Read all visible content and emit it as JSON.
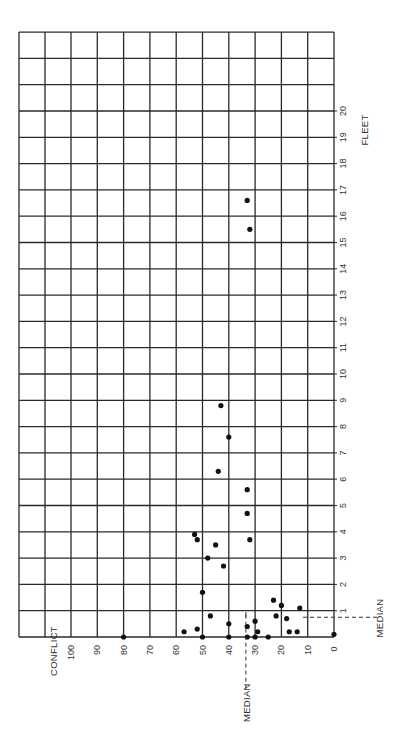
{
  "chart_data": {
    "type": "scatter",
    "orientation": "rotated-90-ccw",
    "title": "",
    "xlabel": "CONFLICT",
    "ylabel": "FLEET",
    "xlim": [
      0,
      100
    ],
    "ylim": [
      0,
      23
    ],
    "x_ticks": [
      100,
      90,
      80,
      70,
      60,
      50,
      40,
      30,
      20,
      10,
      0
    ],
    "y_ticks": [
      1,
      2,
      3,
      4,
      5,
      6,
      7,
      8,
      9,
      10,
      11,
      12,
      13,
      14,
      15,
      16,
      17,
      18,
      19,
      20
    ],
    "grid": true,
    "points": [
      {
        "conflict": 80,
        "fleet": 0.0
      },
      {
        "conflict": 57,
        "fleet": 0.2
      },
      {
        "conflict": 52,
        "fleet": 0.3
      },
      {
        "conflict": 50,
        "fleet": 0.0
      },
      {
        "conflict": 50,
        "fleet": 1.7
      },
      {
        "conflict": 47,
        "fleet": 0.8
      },
      {
        "conflict": 40,
        "fleet": 0.5
      },
      {
        "conflict": 40,
        "fleet": 0.0
      },
      {
        "conflict": 33,
        "fleet": 0.4
      },
      {
        "conflict": 33,
        "fleet": 0.0
      },
      {
        "conflict": 30,
        "fleet": 0.6
      },
      {
        "conflict": 29,
        "fleet": 0.2
      },
      {
        "conflict": 30,
        "fleet": 0.0
      },
      {
        "conflict": 25,
        "fleet": 0.0
      },
      {
        "conflict": 23,
        "fleet": 1.4
      },
      {
        "conflict": 20,
        "fleet": 1.2
      },
      {
        "conflict": 22,
        "fleet": 0.8
      },
      {
        "conflict": 18,
        "fleet": 0.7
      },
      {
        "conflict": 17,
        "fleet": 0.2
      },
      {
        "conflict": 13,
        "fleet": 1.1
      },
      {
        "conflict": 14,
        "fleet": 0.2
      },
      {
        "conflict": 0,
        "fleet": 0.1
      },
      {
        "conflict": 53,
        "fleet": 3.9
      },
      {
        "conflict": 52,
        "fleet": 3.7
      },
      {
        "conflict": 48,
        "fleet": 3.0
      },
      {
        "conflict": 45,
        "fleet": 3.5
      },
      {
        "conflict": 42,
        "fleet": 2.7
      },
      {
        "conflict": 33,
        "fleet": 4.7
      },
      {
        "conflict": 32,
        "fleet": 3.7
      },
      {
        "conflict": 33,
        "fleet": 5.6
      },
      {
        "conflict": 44,
        "fleet": 6.3
      },
      {
        "conflict": 40,
        "fleet": 7.6
      },
      {
        "conflict": 43,
        "fleet": 8.8
      },
      {
        "conflict": 33,
        "fleet": 16.6
      },
      {
        "conflict": 32,
        "fleet": 15.5
      }
    ],
    "annotations": [
      {
        "text": "MEDIAN",
        "axis": "conflict",
        "value": 33.5
      },
      {
        "text": "MEDIAN",
        "axis": "fleet",
        "value": 0.75
      }
    ]
  },
  "labels": {
    "conflict_axis": "CONFLICT",
    "fleet_axis": "FLEET",
    "median_conflict": "MEDIAN",
    "median_fleet": "MEDIAN"
  }
}
